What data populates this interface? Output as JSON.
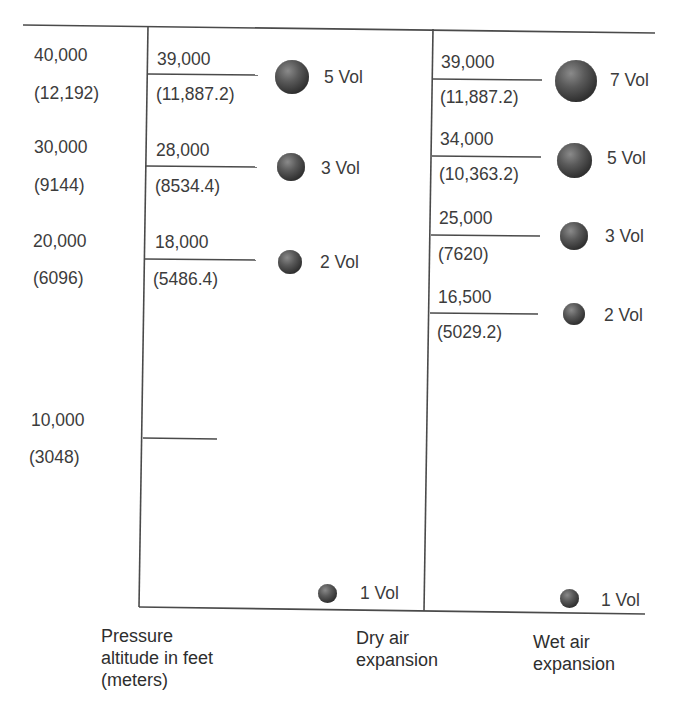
{
  "altitude_axis": {
    "caption": "Pressure\naltitude in feet\n(meters)",
    "ticks": [
      {
        "feet": "40,000",
        "meters": "(12,192)"
      },
      {
        "feet": "30,000",
        "meters": "(9144)"
      },
      {
        "feet": "20,000",
        "meters": "(6096)"
      },
      {
        "feet": "10,000",
        "meters": "(3048)"
      }
    ]
  },
  "dry_air": {
    "caption": "Dry air\nexpansion",
    "levels": [
      {
        "feet": "39,000",
        "meters": "(11,887.2)",
        "volume": "5 Vol"
      },
      {
        "feet": "28,000",
        "meters": "(8534.4)",
        "volume": "3 Vol"
      },
      {
        "feet": "18,000",
        "meters": "(5486.4)",
        "volume": "2 Vol"
      }
    ],
    "ground": {
      "volume": "1 Vol"
    }
  },
  "wet_air": {
    "caption": "Wet air\nexpansion",
    "levels": [
      {
        "feet": "39,000",
        "meters": "(11,887.2)",
        "volume": "7 Vol"
      },
      {
        "feet": "34,000",
        "meters": "(10,363.2)",
        "volume": "5 Vol"
      },
      {
        "feet": "25,000",
        "meters": "(7620)",
        "volume": "3 Vol"
      },
      {
        "feet": "16,500",
        "meters": "(5029.2)",
        "volume": "2 Vol"
      }
    ],
    "ground": {
      "volume": "1 Vol"
    }
  },
  "colors": {
    "line": "#4a4a4a",
    "text": "#3c3c3c",
    "sphere_dark": "#1e1e1e",
    "sphere_light": "#8a8a8a"
  }
}
